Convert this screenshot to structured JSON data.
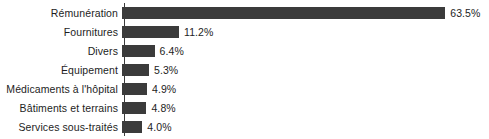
{
  "chart_data": {
    "type": "bar",
    "orientation": "horizontal",
    "title": "",
    "subtitle": "",
    "xlabel": "",
    "ylabel": "",
    "grid": false,
    "legend": null,
    "axis": {
      "visible_axis": "category-axis-left",
      "value_axis_ticks": [],
      "xlim": [
        0,
        63.5
      ],
      "units": "%"
    },
    "bar_color": "#3b3b3b",
    "background_color": "#ffffff",
    "text_color": "#1d1d1d",
    "categories": [
      "Rémunération",
      "Fournitures",
      "Divers",
      "Équipement",
      "Médicaments à l'hôpital",
      "Bâtiments et terrains",
      "Services sous-traités"
    ],
    "values": [
      63.5,
      11.2,
      6.4,
      5.3,
      4.9,
      4.8,
      4.0
    ],
    "value_labels": [
      "63.5%",
      "11.2%",
      "6.4%",
      "5.3%",
      "4.9%",
      "4.8%",
      "4.0%"
    ],
    "rows": [
      {
        "label": "Rémunération",
        "value": 63.5,
        "value_label": "63.5%"
      },
      {
        "label": "Fournitures",
        "value": 11.2,
        "value_label": "11.2%"
      },
      {
        "label": "Divers",
        "value": 6.4,
        "value_label": "6.4%"
      },
      {
        "label": "Équipement",
        "value": 5.3,
        "value_label": "5.3%"
      },
      {
        "label": "Médicaments à l'hôpital",
        "value": 4.9,
        "value_label": "4.9%"
      },
      {
        "label": "Bâtiments et terrains",
        "value": 4.8,
        "value_label": "4.8%"
      },
      {
        "label": "Services sous-traités",
        "value": 4.0,
        "value_label": "4.0%"
      }
    ]
  }
}
